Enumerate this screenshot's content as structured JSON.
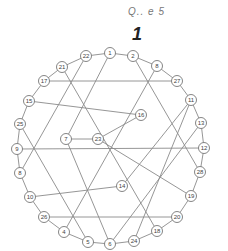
{
  "header": {
    "caption": "Q.. e 5",
    "number": "1"
  },
  "diagram": {
    "type": "circular-graph",
    "ring_order": [
      "1",
      "2",
      "8",
      "27",
      "11",
      "13",
      "12",
      "28",
      "19",
      "20",
      "18",
      "24",
      "6",
      "5",
      "4",
      "26",
      "10",
      "8",
      "9",
      "25",
      "15",
      "17",
      "21",
      "22"
    ],
    "nodes": [
      {
        "id": "n1",
        "label": "1",
        "x": 110,
        "y": 53
      },
      {
        "id": "n2",
        "label": "2",
        "x": 133,
        "y": 56
      },
      {
        "id": "n8a",
        "label": "8",
        "x": 157,
        "y": 66
      },
      {
        "id": "n27",
        "label": "27",
        "x": 177,
        "y": 81
      },
      {
        "id": "n11",
        "label": "11",
        "x": 191,
        "y": 100
      },
      {
        "id": "n13",
        "label": "13",
        "x": 201,
        "y": 123
      },
      {
        "id": "n12",
        "label": "12",
        "x": 204,
        "y": 148
      },
      {
        "id": "n28",
        "label": "28",
        "x": 200,
        "y": 172
      },
      {
        "id": "n19",
        "label": "19",
        "x": 191,
        "y": 196
      },
      {
        "id": "n20",
        "label": "20",
        "x": 177,
        "y": 217
      },
      {
        "id": "n18",
        "label": "18",
        "x": 157,
        "y": 231
      },
      {
        "id": "n24",
        "label": "24",
        "x": 134,
        "y": 241
      },
      {
        "id": "n6",
        "label": "6",
        "x": 110,
        "y": 244
      },
      {
        "id": "n5",
        "label": "5",
        "x": 88,
        "y": 242
      },
      {
        "id": "n4",
        "label": "4",
        "x": 64,
        "y": 232
      },
      {
        "id": "n26",
        "label": "26",
        "x": 44,
        "y": 217
      },
      {
        "id": "n10",
        "label": "10",
        "x": 30,
        "y": 197
      },
      {
        "id": "n8b",
        "label": "8",
        "x": 20,
        "y": 173
      },
      {
        "id": "n9",
        "label": "9",
        "x": 17,
        "y": 149
      },
      {
        "id": "n25",
        "label": "25",
        "x": 20,
        "y": 124
      },
      {
        "id": "n15",
        "label": "15",
        "x": 29,
        "y": 101
      },
      {
        "id": "n17",
        "label": "17",
        "x": 44,
        "y": 81
      },
      {
        "id": "n21",
        "label": "21",
        "x": 62,
        "y": 67
      },
      {
        "id": "n22",
        "label": "22",
        "x": 86,
        "y": 56
      },
      {
        "id": "n7",
        "label": "7",
        "x": 66,
        "y": 139
      },
      {
        "id": "n23",
        "label": "23",
        "x": 98,
        "y": 139
      },
      {
        "id": "n16",
        "label": "16",
        "x": 141,
        "y": 115
      },
      {
        "id": "n14",
        "label": "14",
        "x": 122,
        "y": 186
      }
    ],
    "chords": [
      [
        "n1",
        "n7"
      ],
      [
        "n2",
        "n28"
      ],
      [
        "n8a",
        "n4"
      ],
      [
        "n21",
        "n18"
      ],
      [
        "n22",
        "n8b"
      ],
      [
        "n25",
        "n5"
      ],
      [
        "n9",
        "n12"
      ],
      [
        "n17",
        "n27"
      ],
      [
        "n26",
        "n20"
      ],
      [
        "n15",
        "n16"
      ],
      [
        "n16",
        "n23"
      ],
      [
        "n23",
        "n7"
      ],
      [
        "n10",
        "n14"
      ],
      [
        "n11",
        "n24"
      ],
      [
        "n13",
        "n6"
      ],
      [
        "n7",
        "n6"
      ],
      [
        "n14",
        "n11"
      ],
      [
        "n23",
        "n19"
      ]
    ]
  }
}
